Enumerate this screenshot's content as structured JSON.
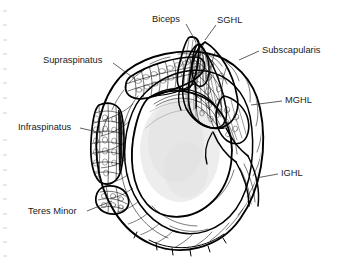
{
  "figure": {
    "background_color": "#ffffff",
    "ink_color": "#000000",
    "text_color": "#1a1a1a",
    "shade_color": "#dedede",
    "width": 345,
    "height": 266
  },
  "labels": {
    "biceps": "Biceps",
    "sghl": "SGHL",
    "subscapularis": "Subscapularis",
    "mghl": "MGHL",
    "ighl": "IGHL",
    "supraspinatus": "Supraspinatus",
    "infraspinatus": "Infraspinatus",
    "teres_minor": "Teres Minor"
  },
  "annotations": [
    {
      "key": "biceps",
      "label": "Biceps",
      "side": "top",
      "text_x": 152,
      "text_y": 20,
      "anchor": "start",
      "leader": "M 186 24 L 196 42"
    },
    {
      "key": "sghl",
      "label": "SGHL",
      "side": "top-right",
      "text_x": 217,
      "text_y": 21,
      "anchor": "start",
      "leader": "M 216 25 L 205 40"
    },
    {
      "key": "subscapularis",
      "label": "Subscapularis",
      "side": "right",
      "text_x": 262,
      "text_y": 51,
      "anchor": "start",
      "leader": "M 259 51 L 239 60"
    },
    {
      "key": "mghl",
      "label": "MGHL",
      "side": "right",
      "text_x": 285,
      "text_y": 101,
      "anchor": "start",
      "leader": "M 282 101 L 251 105"
    },
    {
      "key": "ighl",
      "label": "IGHL",
      "side": "right",
      "text_x": 281,
      "text_y": 174,
      "anchor": "start",
      "leader": "M 278 174 L 256 178"
    },
    {
      "key": "supraspinatus",
      "label": "Supraspinatus",
      "side": "left",
      "text_x": 43,
      "text_y": 61,
      "anchor": "start",
      "leader": "M 113 63 L 135 79"
    },
    {
      "key": "infraspinatus",
      "label": "Infraspinatus",
      "side": "left",
      "text_x": 18,
      "text_y": 128,
      "anchor": "start",
      "leader": "M 80 128 L 102 133"
    },
    {
      "key": "teres_minor",
      "label": "Teres Minor",
      "side": "left",
      "text_x": 28,
      "text_y": 212,
      "anchor": "start",
      "leader": "M 87 211 L 112 201"
    }
  ],
  "structures": [
    {
      "key": "humeral-head",
      "name": "Humeral head"
    },
    {
      "key": "joint-capsule",
      "name": "Joint capsule"
    },
    {
      "key": "supraspinatus-muscle",
      "name": "Supraspinatus muscle"
    },
    {
      "key": "infraspinatus-muscle",
      "name": "Infraspinatus muscle"
    },
    {
      "key": "teres-minor-muscle",
      "name": "Teres minor muscle"
    },
    {
      "key": "subscapularis-muscle",
      "name": "Subscapularis muscle"
    },
    {
      "key": "biceps-tendon",
      "name": "Long head of biceps tendon"
    },
    {
      "key": "sghl-ligament",
      "name": "Superior glenohumeral ligament"
    },
    {
      "key": "mghl-ligament",
      "name": "Middle glenohumeral ligament"
    },
    {
      "key": "ighl-ligament",
      "name": "Inferior glenohumeral ligament"
    }
  ],
  "edge_marks": {
    "present": true,
    "color": "#c9c9c9",
    "count": 17
  }
}
